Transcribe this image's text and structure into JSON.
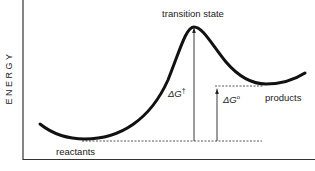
{
  "diagram": {
    "type": "reaction-energy-profile",
    "y_axis_label": "ENERGY",
    "labels": {
      "transition_state": "transition state",
      "reactants": "reactants",
      "products": "products",
      "activation_energy_symbol": "ΔG",
      "activation_energy_superscript": "†",
      "free_energy_symbol": "ΔG",
      "free_energy_superscript": "o"
    },
    "colors": {
      "curve": "#111111",
      "axes": "#333333",
      "dashed": "#444444",
      "text": "#222222"
    }
  }
}
